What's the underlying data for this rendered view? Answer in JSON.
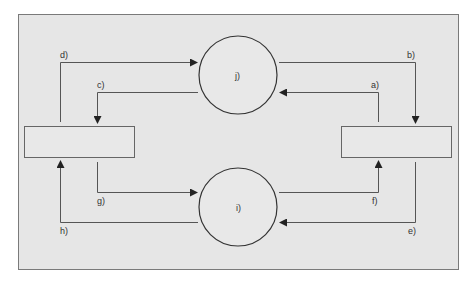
{
  "colors": {
    "page_bg": "#ffffff",
    "frame_bg": "#e6e6e6",
    "frame_stroke": "#7a7a7a",
    "line": "#555555",
    "circle_stroke": "#333333",
    "box_stroke": "#666666"
  },
  "nodes": {
    "circle_top": {
      "label": "j)"
    },
    "circle_bottom": {
      "label": "i)"
    },
    "box_left": {
      "label": ""
    },
    "box_right": {
      "label": ""
    }
  },
  "arrows": [
    {
      "id": "a",
      "label": "a)",
      "from": "box_right",
      "to": "circle_top"
    },
    {
      "id": "b",
      "label": "b)",
      "from": "circle_top",
      "to": "box_right"
    },
    {
      "id": "c",
      "label": "c)",
      "from": "circle_top",
      "to": "box_left"
    },
    {
      "id": "d",
      "label": "d)",
      "from": "box_left",
      "to": "circle_top"
    },
    {
      "id": "e",
      "label": "e)",
      "from": "box_right",
      "to": "circle_bottom"
    },
    {
      "id": "f",
      "label": "f)",
      "from": "circle_bottom",
      "to": "box_right"
    },
    {
      "id": "g",
      "label": "g)",
      "from": "box_left",
      "to": "circle_bottom"
    },
    {
      "id": "h",
      "label": "h)",
      "from": "circle_bottom",
      "to": "box_left"
    }
  ]
}
